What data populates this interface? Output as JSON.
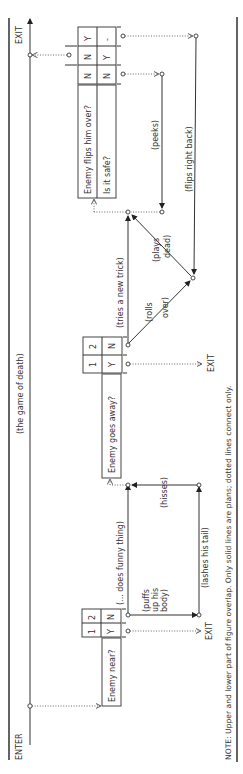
{
  "title": "(the game of death)",
  "labels": {
    "enter": "ENTER",
    "exit_main": "EXIT",
    "exit_1": "EXIT",
    "exit_2": "EXIT"
  },
  "note": "NOTE: Upper and lower part of figure overlap. Only solid lines are plans; dotted lines connect only.",
  "tables": [
    {
      "question": "Enemy near?",
      "columns": [
        {
          "header": "1",
          "values": [
            "Y"
          ]
        },
        {
          "header": "2",
          "values": [
            "N"
          ]
        }
      ]
    },
    {
      "question": "Enemy goes away?",
      "columns": [
        {
          "header": "1",
          "values": [
            "Y"
          ]
        },
        {
          "header": "2",
          "values": [
            "N"
          ]
        }
      ]
    },
    {
      "questions": [
        "Enemy flips him over?",
        "Is it safe?"
      ],
      "columns": [
        {
          "values": [
            "N",
            "N"
          ]
        },
        {
          "values": [
            "N",
            "Y"
          ]
        },
        {
          "values": [
            "Y",
            "-"
          ]
        }
      ]
    }
  ],
  "actions": {
    "does_funny_thing": "(... does funny thing)",
    "puffs": [
      "(puffs",
      "up his",
      "body)"
    ],
    "lashes": "(lashes his tail)",
    "hisses": "(hisses)",
    "tries_new_trick": "(tries a new trick)",
    "rolls_over": [
      "(rolls",
      "over)"
    ],
    "plays_dead": [
      "(plays",
      "dead)"
    ],
    "peeks": "(peeks)",
    "flips_right_back": "(flips right back)"
  }
}
